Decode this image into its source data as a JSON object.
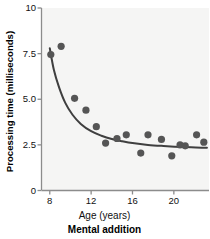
{
  "chart_data": {
    "type": "scatter",
    "title": "Mental addition",
    "xlabel": "Age (years)",
    "ylabel": "Processing time (milliseconds)",
    "xlim": [
      7.2,
      23.4
    ],
    "ylim": [
      0,
      10
    ],
    "xticks": [
      8,
      12,
      16,
      20
    ],
    "xtick_labels": [
      "8",
      "12",
      "16",
      "20"
    ],
    "yticks": [
      0,
      2.5,
      5.0,
      7.5,
      10
    ],
    "ytick_labels": [
      "0",
      "2.5",
      "5.0",
      "7.5",
      "10"
    ],
    "grid": false,
    "legend": null,
    "marker_color": "#555555",
    "curve_color": "#3f3f3f",
    "plot_background": "#f5f5f4",
    "series": [
      {
        "name": "Processing time",
        "kind": "points",
        "points": [
          {
            "x": 8.1,
            "y": 7.45
          },
          {
            "x": 9.1,
            "y": 7.9
          },
          {
            "x": 10.4,
            "y": 5.05
          },
          {
            "x": 11.5,
            "y": 4.4
          },
          {
            "x": 12.5,
            "y": 3.5
          },
          {
            "x": 13.4,
            "y": 2.6
          },
          {
            "x": 14.5,
            "y": 2.85
          },
          {
            "x": 15.4,
            "y": 3.05
          },
          {
            "x": 16.8,
            "y": 2.05
          },
          {
            "x": 17.5,
            "y": 3.05
          },
          {
            "x": 18.8,
            "y": 2.8
          },
          {
            "x": 19.8,
            "y": 1.9
          },
          {
            "x": 20.6,
            "y": 2.5
          },
          {
            "x": 21.1,
            "y": 2.45
          },
          {
            "x": 22.2,
            "y": 3.05
          },
          {
            "x": 22.9,
            "y": 2.65
          }
        ]
      },
      {
        "name": "Fitted decay curve",
        "kind": "curve",
        "points": [
          {
            "x": 8.0,
            "y": 7.8
          },
          {
            "x": 8.4,
            "y": 6.6
          },
          {
            "x": 8.9,
            "y": 5.65
          },
          {
            "x": 9.5,
            "y": 4.8
          },
          {
            "x": 10.2,
            "y": 4.15
          },
          {
            "x": 11.0,
            "y": 3.65
          },
          {
            "x": 12.0,
            "y": 3.25
          },
          {
            "x": 13.0,
            "y": 3.0
          },
          {
            "x": 14.0,
            "y": 2.82
          },
          {
            "x": 15.0,
            "y": 2.7
          },
          {
            "x": 16.0,
            "y": 2.6
          },
          {
            "x": 17.5,
            "y": 2.5
          },
          {
            "x": 19.0,
            "y": 2.44
          },
          {
            "x": 21.0,
            "y": 2.38
          },
          {
            "x": 23.2,
            "y": 2.34
          }
        ]
      }
    ]
  }
}
